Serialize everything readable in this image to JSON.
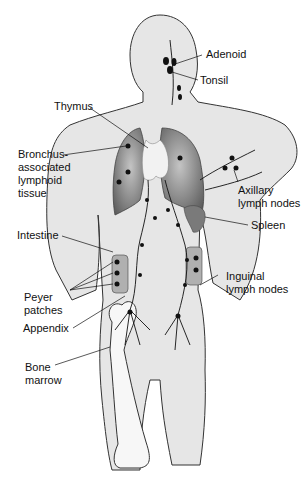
{
  "diagram": {
    "colors": {
      "body_fill": "#e6e6e6",
      "outline": "#333333",
      "lung_dark": "#6f6f6f",
      "lung_light": "#b8b8b8",
      "thymus": "#f2f2f2",
      "bone": "#f7f7f7",
      "node": "#111111",
      "label_text": "#111111"
    },
    "labels": [
      {
        "id": "adenoid",
        "text": "Adenoid"
      },
      {
        "id": "tonsil",
        "text": "Tonsil"
      },
      {
        "id": "thymus",
        "text": "Thymus"
      },
      {
        "id": "balt",
        "text": "Bronchus-\nassociated\nlymphoid\ntissue"
      },
      {
        "id": "axillary",
        "text": "Axillary\nlymph nodes"
      },
      {
        "id": "spleen",
        "text": "Spleen"
      },
      {
        "id": "intestine",
        "text": "Intestine"
      },
      {
        "id": "peyer",
        "text": "Peyer\npatches"
      },
      {
        "id": "inguinal",
        "text": "Inguinal\nlymph nodes"
      },
      {
        "id": "appendix",
        "text": "Appendix"
      },
      {
        "id": "bone_marrow",
        "text": "Bone\nmarrow"
      }
    ]
  }
}
